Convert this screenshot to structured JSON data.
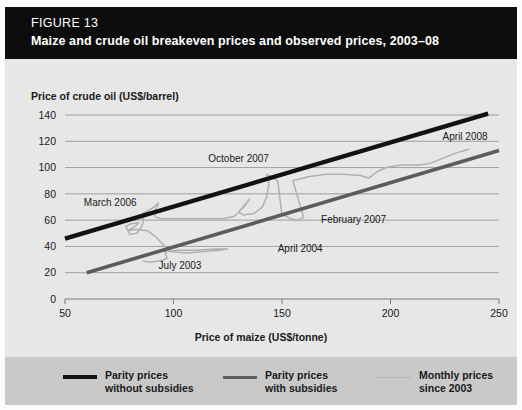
{
  "figure": {
    "label": "FIGURE 13",
    "title": "Maize and crude oil breakeven prices and observed prices, 2003–08"
  },
  "axes": {
    "y_title": "Price of crude oil (US$/barrel)",
    "x_title": "Price of maize (US$/tonne)",
    "y_ticks": [
      "0",
      "20",
      "40",
      "60",
      "80",
      "100",
      "120",
      "140"
    ],
    "x_ticks": [
      "50",
      "100",
      "150",
      "200",
      "250"
    ]
  },
  "legend": {
    "items": [
      {
        "label_line1": "Parity prices",
        "label_line2": "without subsidies",
        "style": "thick-black",
        "color": "#121212"
      },
      {
        "label_line1": "Parity prices",
        "label_line2": "with subsidies",
        "style": "medium-gray",
        "color": "#5c5c5c"
      },
      {
        "label_line1": "Monthly prices",
        "label_line2": "since 2003",
        "style": "thin-lightgray",
        "color": "#b0b0b0"
      }
    ]
  },
  "annotations": [
    {
      "text": "March 2006",
      "x": 83,
      "y": 71
    },
    {
      "text": "July 2003",
      "x": 103,
      "y": 23
    },
    {
      "text": "April 2004",
      "x": 148,
      "y": 36
    },
    {
      "text": "October 2007",
      "x": 130,
      "y": 104
    },
    {
      "text": "February 2007",
      "x": 168,
      "y": 58
    },
    {
      "text": "April 2008",
      "x": 224,
      "y": 121
    }
  ],
  "colors": {
    "header_bg": "#0d0d0d",
    "header_text": "#ffffff",
    "chart_bg": "#e7e7e7",
    "legend_bg": "#c9c9c9",
    "gridline": "#8d8d8d",
    "parity_without_subsidies": "#121212",
    "parity_with_subsidies": "#5c5c5c",
    "monthly_prices": "#b0b0b0"
  },
  "chart_data": {
    "type": "line",
    "title": "Maize and crude oil breakeven prices and observed prices, 2003–08",
    "xlabel": "Price of maize (US$/tonne)",
    "ylabel": "Price of crude oil (US$/barrel)",
    "xlim": [
      50,
      250
    ],
    "ylim": [
      0,
      140
    ],
    "xticks": [
      50,
      100,
      150,
      200,
      250
    ],
    "yticks": [
      0,
      20,
      40,
      60,
      80,
      100,
      120,
      140
    ],
    "grid": "horizontal",
    "legend_position": "below-plot",
    "series": [
      {
        "name": "Parity prices without subsidies",
        "color": "#121212",
        "style": "thick solid line",
        "points": [
          [
            50,
            46
          ],
          [
            245,
            141
          ]
        ]
      },
      {
        "name": "Parity prices with subsidies",
        "color": "#5c5c5c",
        "style": "medium solid line",
        "points": [
          [
            60,
            20
          ],
          [
            250,
            113
          ]
        ]
      },
      {
        "name": "Monthly prices since 2003",
        "color": "#b0b0b0",
        "style": "thin solid line",
        "points": [
          [
            86,
            29
          ],
          [
            89,
            28
          ],
          [
            93,
            29
          ],
          [
            96,
            30
          ],
          [
            97,
            31
          ],
          [
            96,
            36
          ],
          [
            101,
            37
          ],
          [
            110,
            37
          ],
          [
            119,
            38
          ],
          [
            125,
            38
          ],
          [
            121,
            37
          ],
          [
            113,
            36
          ],
          [
            106,
            35
          ],
          [
            99,
            36
          ],
          [
            96,
            40
          ],
          [
            92,
            47
          ],
          [
            88,
            52
          ],
          [
            82,
            53
          ],
          [
            79,
            52
          ],
          [
            78,
            55
          ],
          [
            80,
            57
          ],
          [
            84,
            58
          ],
          [
            82,
            55
          ],
          [
            79,
            52
          ],
          [
            80,
            49
          ],
          [
            83,
            50
          ],
          [
            85,
            54
          ],
          [
            86,
            58
          ],
          [
            86,
            61
          ],
          [
            85,
            64
          ],
          [
            87,
            66
          ],
          [
            89,
            68
          ],
          [
            91,
            70
          ],
          [
            93,
            73
          ],
          [
            92,
            69
          ],
          [
            91,
            65
          ],
          [
            92,
            62
          ],
          [
            95,
            61
          ],
          [
            100,
            61
          ],
          [
            108,
            61
          ],
          [
            116,
            61
          ],
          [
            123,
            61
          ],
          [
            128,
            63
          ],
          [
            133,
            71
          ],
          [
            135,
            76
          ],
          [
            133,
            72
          ],
          [
            130,
            66
          ],
          [
            132,
            64
          ],
          [
            137,
            65
          ],
          [
            141,
            70
          ],
          [
            143,
            78
          ],
          [
            144,
            88
          ],
          [
            143,
            95
          ],
          [
            145,
            93
          ],
          [
            148,
            90
          ],
          [
            150,
            64
          ],
          [
            152,
            63
          ],
          [
            154,
            61
          ],
          [
            157,
            60
          ],
          [
            160,
            62
          ],
          [
            155,
            90
          ],
          [
            162,
            93
          ],
          [
            170,
            95
          ],
          [
            178,
            95
          ],
          [
            186,
            94
          ],
          [
            190,
            92
          ],
          [
            194,
            97
          ],
          [
            198,
            100
          ],
          [
            205,
            102
          ],
          [
            213,
            102
          ],
          [
            218,
            103
          ],
          [
            224,
            107
          ],
          [
            230,
            111
          ],
          [
            236,
            114
          ]
        ]
      }
    ],
    "annotations": [
      {
        "text": "July 2003",
        "x": 103,
        "y": 23
      },
      {
        "text": "April 2004",
        "x": 148,
        "y": 36
      },
      {
        "text": "March 2006",
        "x": 83,
        "y": 71
      },
      {
        "text": "February 2007",
        "x": 168,
        "y": 58
      },
      {
        "text": "October 2007",
        "x": 130,
        "y": 104
      },
      {
        "text": "April 2008",
        "x": 224,
        "y": 121
      }
    ]
  }
}
